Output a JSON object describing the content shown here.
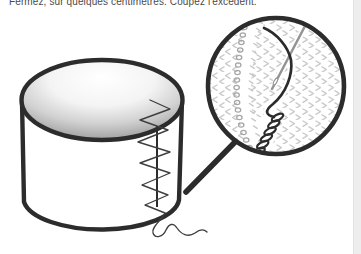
{
  "caption": {
    "text": "Fermez, sur quelques centimètres. Coupez l'excédent."
  },
  "figure": {
    "detail": "magnified-circle-showing-needle-thread-and-overcast-stitches"
  },
  "colors": {
    "paper": "#ffffff",
    "ink": "#2c2c2c",
    "caption_text": "#4a4a4a",
    "texture_mark": "#cccccc",
    "seam_loop": "#a6a6a6",
    "seam_dash": "#c8c8c8",
    "needle": "#949494",
    "top_shade_dark": "#8f8f8f",
    "page_edge": "#ededed"
  }
}
